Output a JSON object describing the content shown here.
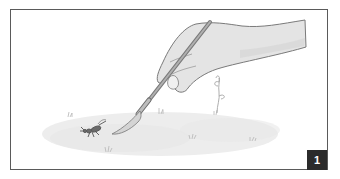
{
  "illustration": {
    "description": "Hand holding a paintbrush gently nudging a small insect on a grassy patch",
    "step_number": "1",
    "colors": {
      "frame": "#5a5a5a",
      "hand_fill": "#e4e4e4",
      "hand_stroke": "#7a7a7a",
      "brush_handle": "#8a8a8a",
      "ground": "#ececec",
      "insect": "#555555",
      "badge_bg": "#2b2b2b",
      "badge_text": "#ffffff"
    }
  }
}
